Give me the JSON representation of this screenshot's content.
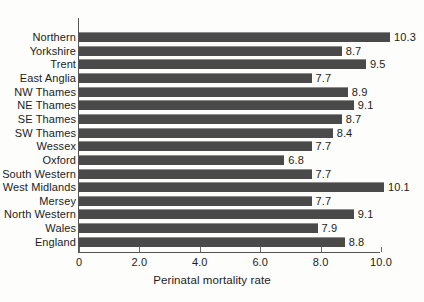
{
  "chart_data": {
    "type": "bar",
    "orientation": "horizontal",
    "title": "",
    "xlabel": "Perinatal mortality rate",
    "ylabel": "",
    "xlim": [
      0,
      10.0
    ],
    "xticks": [
      "0",
      "2.0",
      "4.0",
      "6.0",
      "8.0",
      "10.0"
    ],
    "xtick_values": [
      0,
      2,
      4,
      6,
      8,
      10
    ],
    "grid": false,
    "legend": null,
    "bar_color": "#4a4a4a",
    "background_color": "#fdfdfb",
    "show_value_labels": true,
    "categories": [
      "Northern",
      "Yorkshire",
      "Trent",
      "East Anglia",
      "NW Thames",
      "NE Thames",
      "SE Thames",
      "SW Thames",
      "Wessex",
      "Oxford",
      "South Western",
      "West Midlands",
      "Mersey",
      "North Western",
      "Wales",
      "England"
    ],
    "values": [
      10.3,
      8.7,
      9.5,
      7.7,
      8.9,
      9.1,
      8.7,
      8.4,
      7.7,
      6.8,
      7.7,
      10.1,
      7.7,
      9.1,
      7.9,
      8.8
    ],
    "value_labels": [
      "10.3",
      "8.7",
      "9.5",
      "7.7",
      "8.9",
      "9.1",
      "8.7",
      "8.4",
      "7.7",
      "6.8",
      "7.7",
      "10.1",
      "7.7",
      "9.1",
      "7.9",
      "8.8"
    ]
  }
}
